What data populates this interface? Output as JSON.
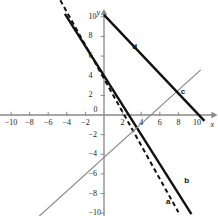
{
  "figure": {
    "title": "",
    "axis_x_name": "x",
    "axis_y_name": "y",
    "background": "#ffffff",
    "axis_color": "#888888",
    "tick_color": "#888888",
    "text_color": "#1a1a1a"
  },
  "chart_data": {
    "type": "line",
    "title": "",
    "xlabel": "x",
    "ylabel": "y",
    "xlim": [
      -11.2,
      12.2
    ],
    "ylim": [
      -11.2,
      10.8
    ],
    "grid": false,
    "legend": "inline-labels",
    "xticks": [
      -10,
      -8,
      -6,
      -4,
      -2,
      0,
      2,
      4,
      6,
      8,
      10
    ],
    "yticks": [
      10,
      8,
      6,
      4,
      2,
      0,
      -2,
      -4,
      -6,
      -8,
      -10
    ],
    "xtick_labels": [
      "-10",
      "-8",
      "-6",
      "-4",
      "-2",
      "0",
      "2",
      "4",
      "6",
      "8",
      "10"
    ],
    "ytick_labels": [
      "10",
      "8",
      "6",
      "4",
      "2",
      "0",
      "-2",
      "-4",
      "-6",
      "-8",
      "-10"
    ],
    "series": [
      {
        "name": "a",
        "label": "a",
        "style": "dashed",
        "color": "#111111",
        "width": 2,
        "slope": -1.7,
        "intercept": 3.7,
        "x": [
          -5.5,
          8.0
        ],
        "y": [
          13.05,
          -9.9
        ],
        "label_x": 6.9,
        "label_y": -8.5
      },
      {
        "name": "b",
        "label": "b",
        "style": "solid",
        "color": "#111111",
        "width": 2.4,
        "slope": -1.5,
        "intercept": 4.0,
        "x": [
          -4.2,
          9.4
        ],
        "y": [
          10.3,
          -10.1
        ],
        "label_x": 8.9,
        "label_y": -6.3
      },
      {
        "name": "c",
        "label": "c",
        "style": "solid",
        "color": "#8a8a8a",
        "width": 1.2,
        "slope": 0.86,
        "intercept": -4.3,
        "x": [
          -7.2,
          10.4
        ],
        "y": [
          -10.5,
          4.6
        ],
        "label_x": 8.5,
        "label_y": 2.8
      },
      {
        "name": "d",
        "label": "d",
        "style": "solid",
        "color": "#111111",
        "width": 2.4,
        "slope": -1.0,
        "intercept": 10.2,
        "x": [
          0.0,
          10.8
        ],
        "y": [
          10.2,
          -0.6
        ],
        "label_x": 3.3,
        "label_y": 7.3
      }
    ]
  }
}
